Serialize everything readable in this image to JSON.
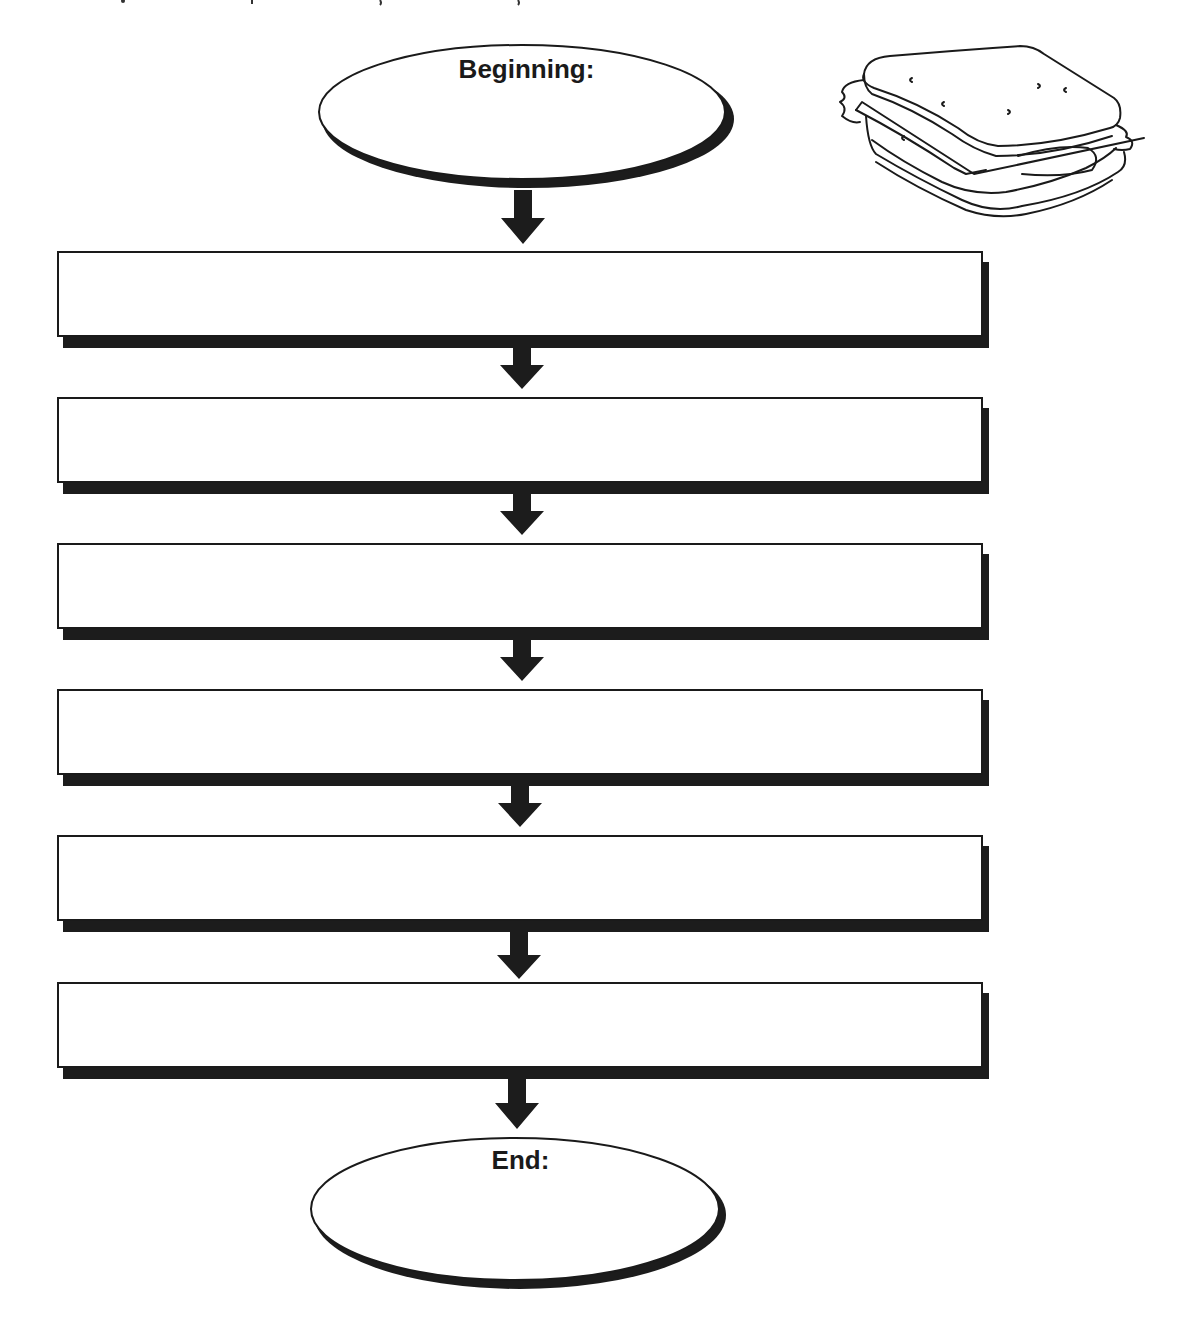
{
  "diagram": {
    "type": "sequence-flowchart-worksheet",
    "start": {
      "label": "Beginning:"
    },
    "steps": [
      {
        "label": ""
      },
      {
        "label": ""
      },
      {
        "label": ""
      },
      {
        "label": ""
      },
      {
        "label": ""
      },
      {
        "label": ""
      }
    ],
    "end": {
      "label": "End:"
    },
    "illustration": "sandwich-icon",
    "colors": {
      "stroke": "#1a1a1a",
      "shadow": "#1c1c1c",
      "fill": "#ffffff"
    }
  }
}
